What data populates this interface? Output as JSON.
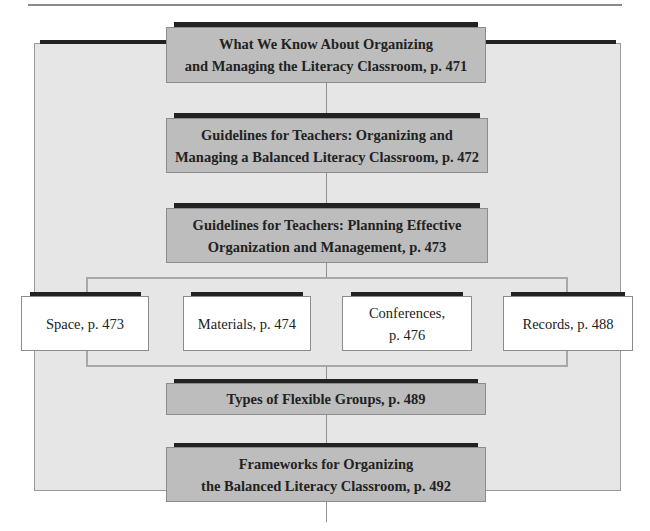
{
  "diagram": {
    "top_box": {
      "label": "What We Know About Organizing\nand Managing the Literacy Classroom, p. 471"
    },
    "main_boxes": [
      {
        "label": "Guidelines for Teachers: Organizing and\nManaging a Balanced Literacy Classroom, p. 472"
      },
      {
        "label": "Guidelines for Teachers: Planning Effective\nOrganization and Management, p. 473"
      }
    ],
    "sub_boxes": [
      {
        "label": "Space, p. 473"
      },
      {
        "label": "Materials, p. 474"
      },
      {
        "label": "Conferences,\np. 476"
      },
      {
        "label": "Records, p. 488"
      }
    ],
    "bottom_boxes": [
      {
        "label": "Types of Flexible Groups, p. 489"
      },
      {
        "label": "Frameworks for Organizing\nthe Balanced Literacy Classroom, p. 492"
      }
    ],
    "colors": {
      "panel": "#e6e6e6",
      "gray_box": "#bdbdbd",
      "bar": "#222222",
      "connector": "#8f8f8f"
    }
  }
}
